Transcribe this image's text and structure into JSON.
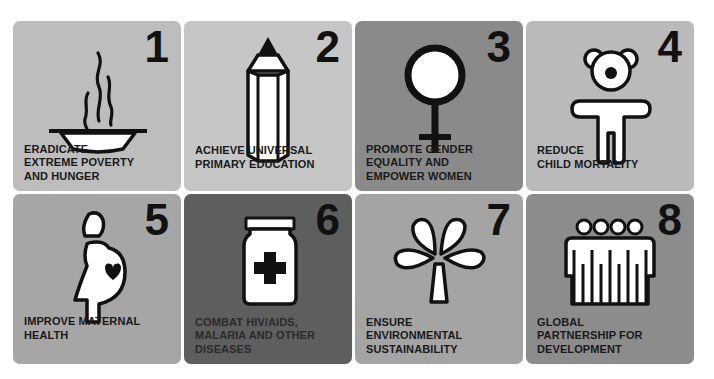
{
  "goals": [
    {
      "number": "1",
      "icon": "bowl-steam-icon",
      "lines": [
        "ERADICATE",
        "EXTREME POVERTY",
        "AND HUNGER"
      ],
      "color": "#bdbdbd"
    },
    {
      "number": "2",
      "icon": "pencil-icon",
      "lines": [
        "ACHIEVE UNIVERSAL",
        "PRIMARY EDUCATION"
      ],
      "color": "#c6c6c6"
    },
    {
      "number": "3",
      "icon": "female-symbol-icon",
      "lines": [
        "PROMOTE GENDER",
        "EQUALITY AND",
        "EMPOWER WOMEN"
      ],
      "color": "#8a8a8a"
    },
    {
      "number": "4",
      "icon": "child-teddy-icon",
      "lines": [
        "REDUCE",
        "CHILD MORTALITY"
      ],
      "color": "#bababa"
    },
    {
      "number": "5",
      "icon": "pregnant-woman-heart-icon",
      "lines": [
        "IMPROVE MATERNAL",
        "HEALTH"
      ],
      "color": "#a6a6a6"
    },
    {
      "number": "6",
      "icon": "medicine-jar-cross-icon",
      "lines": [
        "COMBAT HIV/AIDS,",
        "MALARIA AND OTHER",
        "DISEASES"
      ],
      "color": "#5e5e5e"
    },
    {
      "number": "7",
      "icon": "tree-leaves-icon",
      "lines": [
        "ENSURE",
        "ENVIRONMENTAL",
        "SUSTAINABILITY"
      ],
      "color": "#a4a4a4"
    },
    {
      "number": "8",
      "icon": "group-people-icon",
      "lines": [
        "GLOBAL",
        "PARTNERSHIP FOR",
        "DEVELOPMENT"
      ],
      "color": "#8c8c8c"
    }
  ]
}
